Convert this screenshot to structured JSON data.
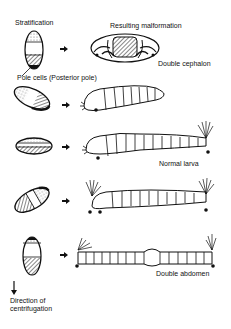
{
  "labels": {
    "stratification": "Stratification",
    "resulting_malformation": "Resulting malformation",
    "double_cephalon": "Double cephalon",
    "pole_cells": "Pole cells (Posterior pole)",
    "normal_larva": "Normal larva",
    "double_abdomen": "Double abdomen",
    "direction_line1": "Direction of",
    "direction_line2": "centrifugation"
  },
  "rows": [
    {
      "egg": "vertical-egg-posterior-pole-cells",
      "result": "Double cephalon"
    },
    {
      "egg": "tilted-egg",
      "result": "short larva"
    },
    {
      "egg": "horizontal-egg",
      "result": "Normal larva"
    },
    {
      "egg": "tilted-egg-anterior-dark",
      "result": "partial double abdomen"
    },
    {
      "egg": "vertical-egg-anterior-dark",
      "result": "Double abdomen"
    }
  ],
  "colors": {
    "ink": "#111111",
    "background": "#ffffff"
  }
}
